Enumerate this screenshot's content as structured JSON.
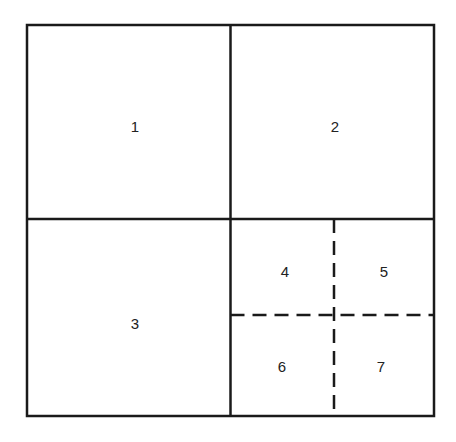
{
  "diagram": {
    "type": "quadtree-partition",
    "regions": [
      {
        "id": "1",
        "label": "1"
      },
      {
        "id": "2",
        "label": "2"
      },
      {
        "id": "3",
        "label": "3"
      },
      {
        "id": "4",
        "label": "4"
      },
      {
        "id": "5",
        "label": "5"
      },
      {
        "id": "6",
        "label": "6"
      },
      {
        "id": "7",
        "label": "7"
      }
    ],
    "colors": {
      "line": "#1a1a1a",
      "background": "#ffffff"
    }
  }
}
